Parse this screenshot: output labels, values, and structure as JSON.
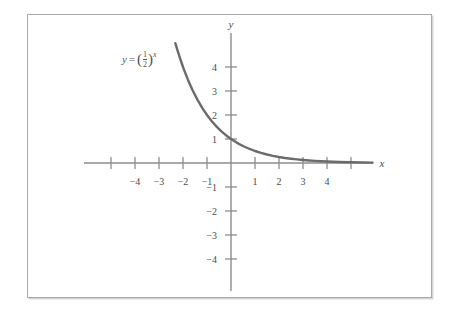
{
  "figure": {
    "kind": "cartesian-function-plot",
    "background_color": "#ffffff",
    "frame_color": "#a9a9ad",
    "axis_color": "#8c8c92",
    "curve_color": "#6b6b6b",
    "text_color": "#4a4a50"
  },
  "labels": {
    "x_axis_name": "x",
    "y_axis_name": "y",
    "equation_lhs": "y",
    "equation_equals": "=",
    "equation_open_paren": "(",
    "equation_numerator": "1",
    "equation_denominator": "2",
    "equation_close_paren": ")",
    "equation_exponent": "x",
    "equation_plain": "y = (1/2)^x"
  },
  "chart_data": {
    "type": "line",
    "title": "",
    "subtitle": "",
    "xlabel": "x",
    "ylabel": "y",
    "xlim": [
      -6.1,
      5.9
    ],
    "ylim": [
      -5.2,
      5.3
    ],
    "grid": false,
    "legend": null,
    "annotations": [
      {
        "text": "y = (1/2)^x",
        "x": -3.9,
        "y": 4.2
      }
    ],
    "x_ticks": [
      -5,
      -4,
      -3,
      -2,
      -1,
      1,
      2,
      3,
      4,
      5
    ],
    "x_tick_labels": [
      "",
      "−4",
      "−3",
      "−2",
      "−1",
      "1",
      "2",
      "3",
      "4",
      ""
    ],
    "y_ticks": [
      -4,
      -3,
      -2,
      -1,
      1,
      2,
      3,
      4
    ],
    "y_tick_labels": [
      "−4",
      "−3",
      "−2",
      "−1",
      "1",
      "2",
      "3",
      "4"
    ],
    "series": [
      {
        "name": "y = (1/2)^x",
        "function": "y = (1/2)^x",
        "color": "#6b6b6b",
        "x": [
          -2.32,
          -2.2,
          -2.0,
          -1.8,
          -1.6,
          -1.4,
          -1.2,
          -1.0,
          -0.8,
          -0.6,
          -0.4,
          -0.2,
          0.0,
          0.25,
          0.5,
          0.75,
          1.0,
          1.25,
          1.5,
          1.75,
          2.0,
          2.25,
          2.5,
          2.75,
          3.0,
          3.25,
          3.5,
          3.75,
          4.0,
          4.5,
          5.0,
          5.9
        ],
        "y": [
          4.995,
          4.595,
          4.0,
          3.482,
          3.031,
          2.639,
          2.297,
          2.0,
          1.741,
          1.516,
          1.32,
          1.149,
          1.0,
          0.841,
          0.707,
          0.595,
          0.5,
          0.42,
          0.354,
          0.297,
          0.25,
          0.21,
          0.177,
          0.149,
          0.125,
          0.105,
          0.088,
          0.074,
          0.0625,
          0.044,
          0.031,
          0.017
        ]
      }
    ],
    "key_points": [
      {
        "x": 0,
        "y": 1,
        "note": "y-intercept"
      },
      {
        "x": 1,
        "y": 0.5
      },
      {
        "x": -1,
        "y": 2
      },
      {
        "x": -2,
        "y": 4
      }
    ],
    "asymptote": {
      "type": "horizontal",
      "y": 0
    }
  }
}
